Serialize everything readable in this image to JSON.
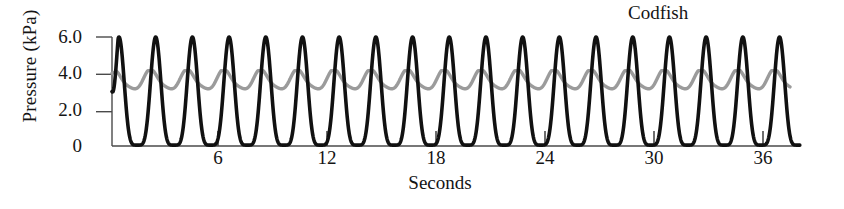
{
  "chart_data": {
    "type": "line",
    "title": "",
    "annotation": "Codfish",
    "xlabel": "Seconds",
    "ylabel": "Pressure (kPa)",
    "xlim": [
      0,
      38
    ],
    "ylim": [
      0,
      6.3
    ],
    "xticks": [
      6,
      12,
      18,
      24,
      30,
      36
    ],
    "xtick_labels": [
      "6",
      "12",
      "18",
      "24",
      "30",
      "36"
    ],
    "yticks": [
      0,
      2.0,
      4.0,
      6.0
    ],
    "ytick_labels": [
      "0",
      "2.0",
      "4.0",
      "6.0"
    ],
    "grid": false,
    "legend": "none",
    "series": [
      {
        "name": "buccal-pressure",
        "color": "#111111",
        "width": 3.6,
        "waveform": "pulse",
        "period_s": 2.02,
        "peak_kPa": 6.0,
        "trough_kPa": 0.05,
        "phase_s": 0.55,
        "start_kPa": 3.0,
        "n_cycles": 19,
        "description": "Large-amplitude buccal pressure oscillation, sharp peaks at 6.0 kPa and troughs near 0 kPa"
      },
      {
        "name": "opercular-pressure",
        "color": "#9b9b9b",
        "width": 3.4,
        "waveform": "smooth",
        "period_s": 2.02,
        "peak_kPa": 4.15,
        "trough_kPa": 3.0,
        "phase_s": 0.3,
        "start_kPa": 4.0,
        "n_cycles": 19,
        "description": "Low-amplitude opercular pressure oscillation between about 3.0 and 4.2 kPa"
      }
    ]
  },
  "axes": {
    "ylabel": "Pressure (kPa)",
    "xlabel": "Seconds",
    "ytick_labels": [
      "6.0",
      "4.0",
      "2.0",
      "0"
    ],
    "xtick_labels": [
      "6",
      "12",
      "18",
      "24",
      "30",
      "36"
    ]
  },
  "annotations": {
    "species": "Codfish"
  }
}
